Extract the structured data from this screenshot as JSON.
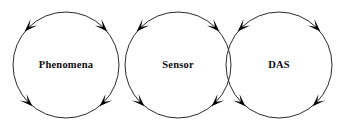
{
  "diagram": {
    "type": "cycle-chain",
    "background_color": "#ffffff",
    "stroke_color": "#2b2b2b",
    "arrow_color": "#000000",
    "text_color": "#0d0d0d",
    "nodes": [
      {
        "id": "phenomena",
        "label": "Phenomena",
        "cx": 66,
        "cy": 65,
        "r": 53,
        "arrow_angles": [
          225,
          315,
          135,
          45
        ],
        "arrow_directions": [
          "down-left",
          "down-right",
          "up-left",
          "up-right"
        ]
      },
      {
        "id": "sensor",
        "label": "Sensor",
        "cx": 178,
        "cy": 65,
        "r": 53,
        "arrow_angles": [
          225,
          315,
          135,
          45
        ],
        "arrow_directions": [
          "down-left",
          "down-right",
          "up-left",
          "up-right"
        ]
      },
      {
        "id": "das",
        "label": "DAS",
        "cx": 279,
        "cy": 65,
        "r": 53,
        "arrow_angles": [
          225,
          315,
          135,
          45
        ],
        "arrow_directions": [
          "down-left",
          "down-right",
          "up-left",
          "up-right"
        ]
      }
    ]
  }
}
